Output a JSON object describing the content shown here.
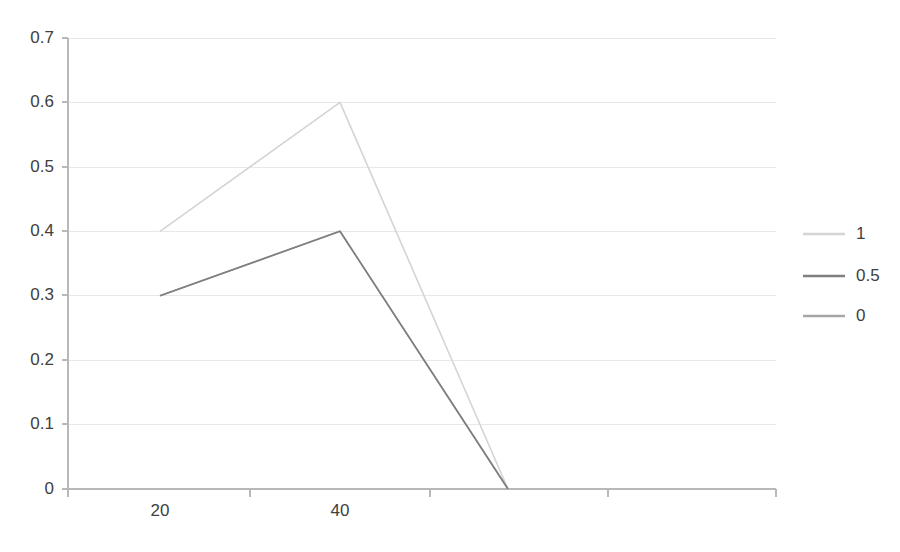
{
  "chart_data": {
    "type": "line",
    "title": "",
    "subtitle": "",
    "xlabel": "",
    "ylabel": "",
    "categories": [
      "20",
      "40",
      ""
    ],
    "x_tick_labels": [
      "20",
      "40",
      ""
    ],
    "y_tick_labels": [
      "0",
      "0.1",
      "0.2",
      "0.3",
      "0.4",
      "0.5",
      "0.6",
      "0.7"
    ],
    "y_tick_values": [
      0,
      0.1,
      0.2,
      0.3,
      0.4,
      0.5,
      0.6,
      0.7
    ],
    "ylim": [
      0,
      0.7
    ],
    "grid": "horizontal",
    "legend_position": "right",
    "series": [
      {
        "name": "1",
        "color": "#d4d4d4",
        "values": [
          0.4,
          0.6,
          0.0
        ]
      },
      {
        "name": "0.5",
        "color": "#7f7f7f",
        "values": [
          0.3,
          0.4,
          0.0
        ]
      },
      {
        "name": "0",
        "color": "#a6a6a6",
        "values": [
          0.3,
          0.4,
          0.0
        ]
      }
    ],
    "annotations": []
  },
  "legend": {
    "entries": [
      {
        "label": "1",
        "color": "#d4d4d4"
      },
      {
        "label": "0.5",
        "color": "#7f7f7f"
      },
      {
        "label": "0",
        "color": "#a6a6a6"
      }
    ]
  },
  "axes": {
    "y": {
      "labels": [
        "0.7",
        "0.6",
        "0.5",
        "0.4",
        "0.3",
        "0.2",
        "0.1",
        "0"
      ]
    },
    "x": {
      "labels": [
        "20",
        "40"
      ]
    }
  },
  "colors": {
    "gridline": "#e8e8e8",
    "axis": "#b8b8b8",
    "text": "#404040",
    "background": "#ffffff"
  }
}
